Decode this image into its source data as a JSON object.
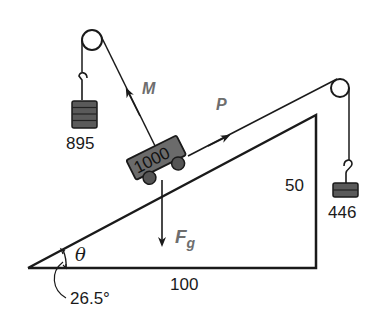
{
  "diagram": {
    "type": "inclined-plane-pulley-system",
    "colors": {
      "line": "#1a1a1a",
      "mass_fill": "#5a5a5a",
      "cart_fill": "#6b6b6b",
      "vector_label": "#6e6e6e",
      "background": "#ffffff"
    },
    "incline": {
      "base_label": "100",
      "height_label": "50",
      "angle_symbol": "θ",
      "angle_value": "26.5°"
    },
    "cart": {
      "mass_label": "1000"
    },
    "left_hanging_mass": {
      "label": "895"
    },
    "right_hanging_mass": {
      "label": "446"
    },
    "forces": {
      "m_label": "M",
      "p_label": "P",
      "fg_label": "F",
      "fg_subscript": "g"
    }
  }
}
